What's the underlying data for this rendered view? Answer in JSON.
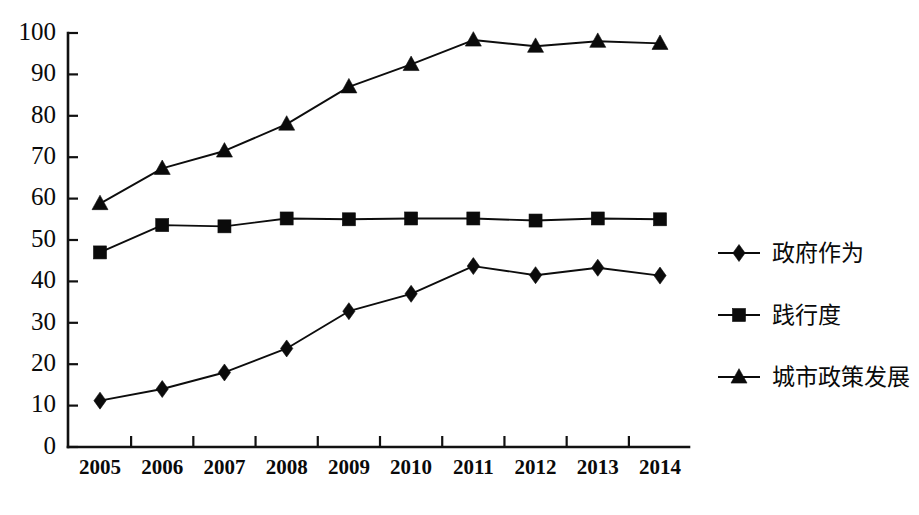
{
  "chart_data": {
    "type": "line",
    "title": "",
    "subtitle": "",
    "xlabel": "",
    "ylabel": "",
    "categories": [
      "2005",
      "2006",
      "2007",
      "2008",
      "2009",
      "2010",
      "2011",
      "2012",
      "2013",
      "2014"
    ],
    "ylim": [
      0,
      100
    ],
    "ytick_labels": [
      "100",
      "90",
      "80",
      "70",
      "60",
      "50",
      "40",
      "30",
      "20",
      "10",
      "0"
    ],
    "ytick_values": [
      100,
      90,
      80,
      70,
      60,
      50,
      40,
      30,
      20,
      10,
      0
    ],
    "grid": false,
    "legend_position": "right",
    "series": [
      {
        "name": "政府作为",
        "marker": "diamond",
        "color": "#0b0b0b",
        "values": [
          11.2,
          14.0,
          18.0,
          23.8,
          32.8,
          37.0,
          43.7,
          41.5,
          43.3,
          41.4
        ]
      },
      {
        "name": "践行度",
        "marker": "square",
        "color": "#0b0b0b",
        "values": [
          47.0,
          53.6,
          53.3,
          55.2,
          55.0,
          55.2,
          55.2,
          54.7,
          55.2,
          55.0
        ]
      },
      {
        "name": "城市政策发展",
        "marker": "triangle",
        "color": "#0b0b0b",
        "values": [
          58.8,
          67.3,
          71.5,
          78.0,
          87.0,
          92.4,
          98.3,
          96.8,
          98.0,
          97.5
        ]
      }
    ]
  },
  "legend": {
    "entries": [
      {
        "label": "政府作为",
        "marker": "diamond"
      },
      {
        "label": "践行度",
        "marker": "square"
      },
      {
        "label": "城市政策发展",
        "marker": "triangle"
      }
    ]
  },
  "caption": {
    "faint_text": ""
  }
}
